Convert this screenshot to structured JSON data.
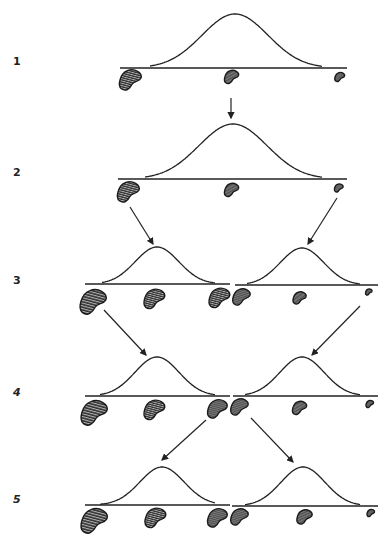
{
  "diagram": {
    "title": "",
    "line_color": "#222222",
    "bean_fill": "#3a3a3a",
    "rows": [
      {
        "label": "1",
        "y": 62,
        "italic": false
      },
      {
        "label": "2",
        "y": 173,
        "italic": false
      },
      {
        "label": "3",
        "y": 281,
        "italic": false
      },
      {
        "label": "4",
        "y": 393,
        "italic": true
      },
      {
        "label": "5",
        "y": 500,
        "italic": true
      }
    ],
    "distributions": [
      {
        "row": 1,
        "base_y": 68,
        "x0": 120,
        "x1": 347,
        "start": 150,
        "end": 322,
        "peak_x": 235,
        "peak_y": 14
      },
      {
        "row": 2,
        "base_y": 179,
        "x0": 118,
        "x1": 347,
        "start": 145,
        "end": 322,
        "peak_x": 233,
        "peak_y": 124
      },
      {
        "row": 3,
        "base_y": 284,
        "x0": 85,
        "x1": 230,
        "start": 102,
        "end": 215,
        "peak_x": 157,
        "peak_y": 247
      },
      {
        "row": 3,
        "base_y": 285,
        "x0": 235,
        "x1": 378,
        "start": 247,
        "end": 360,
        "peak_x": 302,
        "peak_y": 248
      },
      {
        "row": 4,
        "base_y": 396,
        "x0": 85,
        "x1": 230,
        "start": 100,
        "end": 215,
        "peak_x": 157,
        "peak_y": 357
      },
      {
        "row": 4,
        "base_y": 396,
        "x0": 233,
        "x1": 378,
        "start": 245,
        "end": 360,
        "peak_x": 302,
        "peak_y": 357
      },
      {
        "row": 5,
        "base_y": 505,
        "x0": 85,
        "x1": 230,
        "start": 100,
        "end": 215,
        "peak_x": 162,
        "peak_y": 467
      },
      {
        "row": 5,
        "base_y": 506,
        "x0": 232,
        "x1": 378,
        "start": 245,
        "end": 360,
        "peak_x": 303,
        "peak_y": 467
      }
    ],
    "beans": [
      {
        "row": 1,
        "x": 131,
        "y": 80,
        "size": 1.0
      },
      {
        "row": 1,
        "x": 232,
        "y": 77,
        "size": 0.65
      },
      {
        "row": 1,
        "x": 340,
        "y": 77,
        "size": 0.45
      },
      {
        "row": 2,
        "x": 129,
        "y": 192,
        "size": 1.0
      },
      {
        "row": 2,
        "x": 232,
        "y": 190,
        "size": 0.65
      },
      {
        "row": 2,
        "x": 339,
        "y": 188,
        "size": 0.4
      },
      {
        "row": 3,
        "x": 94,
        "y": 302,
        "size": 1.2
      },
      {
        "row": 3,
        "x": 155,
        "y": 299,
        "size": 0.95
      },
      {
        "row": 3,
        "x": 220,
        "y": 298,
        "size": 0.95
      },
      {
        "row": 3,
        "x": 242,
        "y": 297,
        "size": 0.8
      },
      {
        "row": 3,
        "x": 300,
        "y": 298,
        "size": 0.6
      },
      {
        "row": 3,
        "x": 369,
        "y": 292,
        "size": 0.3
      },
      {
        "row": 4,
        "x": 95,
        "y": 413,
        "size": 1.2
      },
      {
        "row": 4,
        "x": 155,
        "y": 410,
        "size": 0.95
      },
      {
        "row": 4,
        "x": 218,
        "y": 409,
        "size": 0.9
      },
      {
        "row": 4,
        "x": 240,
        "y": 407,
        "size": 0.8
      },
      {
        "row": 4,
        "x": 300,
        "y": 408,
        "size": 0.65
      },
      {
        "row": 4,
        "x": 370,
        "y": 404,
        "size": 0.35
      },
      {
        "row": 5,
        "x": 95,
        "y": 521,
        "size": 1.2
      },
      {
        "row": 5,
        "x": 156,
        "y": 518,
        "size": 0.95
      },
      {
        "row": 5,
        "x": 218,
        "y": 518,
        "size": 0.9
      },
      {
        "row": 5,
        "x": 240,
        "y": 517,
        "size": 0.8
      },
      {
        "row": 5,
        "x": 305,
        "y": 517,
        "size": 0.7
      },
      {
        "row": 5,
        "x": 371,
        "y": 513,
        "size": 0.35
      }
    ],
    "arrows": [
      {
        "from": [
          231,
          98
        ],
        "to": [
          231,
          118
        ]
      },
      {
        "from": [
          130,
          207
        ],
        "to": [
          153,
          244
        ]
      },
      {
        "from": [
          337,
          198
        ],
        "to": [
          308,
          244
        ]
      },
      {
        "from": [
          104,
          310
        ],
        "to": [
          146,
          355
        ]
      },
      {
        "from": [
          360,
          306
        ],
        "to": [
          312,
          355
        ]
      },
      {
        "from": [
          206,
          420
        ],
        "to": [
          162,
          460
        ]
      },
      {
        "from": [
          251,
          418
        ],
        "to": [
          293,
          462
        ]
      }
    ]
  }
}
